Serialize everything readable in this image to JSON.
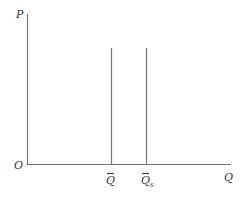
{
  "diagram": {
    "axes": {
      "y_label": "P",
      "x_label": "Q",
      "origin_label": "O",
      "color": "#777777"
    },
    "vertical_lines": [
      {
        "label": "Q",
        "subscript": "",
        "overbar": true,
        "x": 111,
        "y_top": 48
      },
      {
        "label": "Q",
        "subscript": "s",
        "overbar": true,
        "x": 146,
        "y_top": 48
      }
    ]
  }
}
